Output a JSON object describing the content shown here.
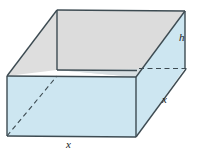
{
  "figure": {
    "name": "rectangular-box-diagram",
    "labels": {
      "height": "h",
      "width_front": "x",
      "depth_side": "x"
    },
    "colors": {
      "front_face_fill": "#cde6f1",
      "right_face_fill": "#cde6f1",
      "bottom_inner_fill": "#cde6f1",
      "top_face_fill": "#dedede",
      "inner_wall_fill": "#e2e2e2",
      "edge_stroke": "#3d4b52",
      "hidden_edge_stroke": "#3d4b52",
      "label_text": "#1a1a1a",
      "background": "#ffffff"
    },
    "geometry": {
      "front_bottom_left": [
        7,
        136
      ],
      "front_top_left": [
        7,
        76
      ],
      "front_bottom_right": [
        136,
        137
      ],
      "front_top_right": [
        136,
        77
      ],
      "back_top_left": [
        57,
        10
      ],
      "back_top_right": [
        185,
        11
      ],
      "inner_left": [
        57,
        70
      ],
      "inner_right": [
        185,
        68
      ],
      "hidden_horizontal_edge": [
        [
          140,
          68
        ],
        [
          188,
          68
        ]
      ],
      "hidden_diagonal_edge": [
        [
          7,
          136
        ],
        [
          57,
          76
        ]
      ]
    },
    "edges": {
      "visible_solid": 9,
      "hidden_dashed": 2
    }
  }
}
